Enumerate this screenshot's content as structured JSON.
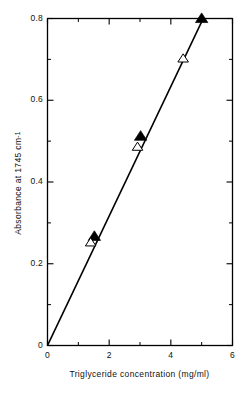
{
  "chart_data": {
    "type": "scatter",
    "title": "",
    "subtitle": "",
    "xlabel": "Triglyceride concentration (mg/ml)",
    "ylabel": "Absorbance at 1745 cm",
    "ylabel_superscript": "-1",
    "xlim": [
      0,
      6
    ],
    "ylim": [
      0,
      0.8
    ],
    "grid": false,
    "legend": "none",
    "x_major_ticks": [
      0,
      2,
      4,
      6
    ],
    "x_minor_ticks": [
      1,
      3,
      5
    ],
    "y_major_ticks": [
      0,
      0.2,
      0.4,
      0.6,
      0.8
    ],
    "y_minor_ticks": [
      0.1,
      0.3,
      0.5,
      0.7
    ],
    "x_tick_labels": [
      "0",
      "2",
      "4",
      "6"
    ],
    "y_tick_labels": [
      "0",
      "0.2",
      "0.4",
      "0.6",
      "0.8"
    ],
    "series": [
      {
        "name": "filled-triangle",
        "marker": "filled-triangle",
        "x": [
          1.52,
          3.02,
          5.0
        ],
        "y": [
          0.267,
          0.512,
          0.8
        ]
      },
      {
        "name": "open-triangle",
        "marker": "open-triangle",
        "x": [
          1.4,
          2.92,
          4.4
        ],
        "y": [
          0.252,
          0.486,
          0.702
        ]
      }
    ],
    "fit_line": {
      "name": "regression-line",
      "x": [
        0,
        5.05
      ],
      "y": [
        0,
        0.8
      ],
      "slope": 0.1584,
      "intercept": 0
    }
  }
}
